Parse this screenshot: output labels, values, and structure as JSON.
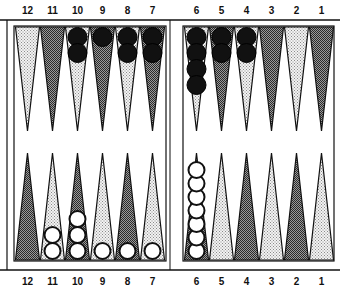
{
  "board": {
    "top_labels": [
      "12",
      "11",
      "10",
      "9",
      "8",
      "7",
      "6",
      "5",
      "4",
      "3",
      "2",
      "1"
    ],
    "bottom_labels": [
      "12",
      "11",
      "10",
      "9",
      "8",
      "7",
      "6",
      "5",
      "4",
      "3",
      "2",
      "1"
    ],
    "top_shading": [
      "light",
      "dark",
      "light",
      "dark",
      "light",
      "dark",
      "light",
      "dark",
      "light",
      "dark",
      "light",
      "dark"
    ],
    "bottom_shading": [
      "dark",
      "light",
      "dark",
      "light",
      "dark",
      "light",
      "dark",
      "light",
      "dark",
      "light",
      "dark",
      "light"
    ],
    "black_checkers_top": [
      0,
      0,
      2,
      1,
      2,
      2,
      4,
      2,
      2,
      0,
      0,
      0
    ],
    "white_checkers_bottom": [
      0,
      2,
      3,
      1,
      1,
      1,
      7,
      0,
      0,
      0,
      0,
      0
    ],
    "colors": {
      "frame": "#111111",
      "light_point": "#d9d9d9",
      "dark_point": "#6e6e6e",
      "black_checker": "#111111",
      "white_checker": "#ffffff"
    }
  }
}
